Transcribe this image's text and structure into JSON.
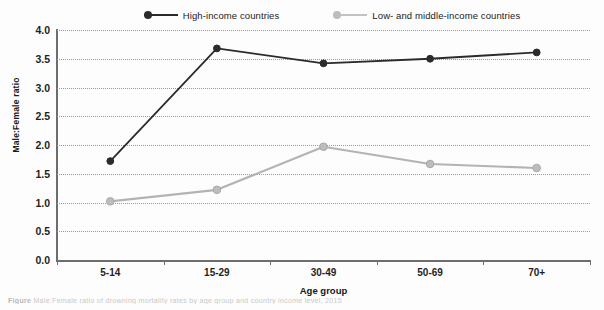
{
  "chart_data": {
    "type": "line",
    "title": "",
    "xlabel": "Age group",
    "ylabel": "Male:Female ratio",
    "categories": [
      "5-14",
      "15-29",
      "30-49",
      "50-69",
      "70+"
    ],
    "ylim": [
      0.0,
      4.0
    ],
    "ytick_labels": [
      "4.0",
      "3.5",
      "3.0",
      "2.5",
      "2.0",
      "1.5",
      "1.0",
      "0.5",
      "0.0"
    ],
    "ytick_values": [
      4.0,
      3.5,
      3.0,
      2.5,
      2.0,
      1.5,
      1.0,
      0.5,
      0.0
    ],
    "grid": "horizontal-dotted",
    "legend_position": "top-center",
    "series": [
      {
        "name": "High-income countries",
        "color": "#2b2b2b",
        "marker": "circle",
        "values": [
          1.72,
          3.68,
          3.42,
          3.5,
          3.61
        ]
      },
      {
        "name": "Low- and middle-income countries",
        "color": "#b3b3b3",
        "marker": "circle",
        "values": [
          1.02,
          1.22,
          1.97,
          1.67,
          1.6
        ]
      }
    ]
  },
  "legend": {
    "items": [
      {
        "label": "High-income countries",
        "color": "#2b2b2b"
      },
      {
        "label": "Low- and middle-income countries",
        "color": "#b3b3b3"
      }
    ]
  },
  "caption": {
    "prefix": "Figure",
    "text": "Male:Female ratio of drowning mortality rates by age group and country income level, 2015"
  },
  "colors": {
    "high_income": "#2b2b2b",
    "low_middle_income": "#b3b3b3",
    "axis": "#6d6d6d",
    "grid": "#9a9a9a",
    "background": "#fdfdfd"
  }
}
